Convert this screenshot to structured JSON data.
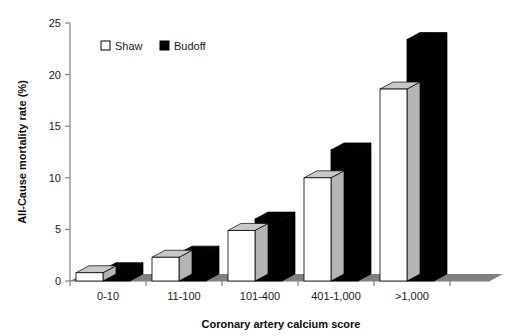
{
  "chart_data": {
    "type": "bar",
    "title": "",
    "xlabel": "Coronary artery calcium score",
    "ylabel": "All-Cause mortality rate (%)",
    "categories": [
      "0-10",
      "11-100",
      "101-400",
      "401-1,000",
      ">1,000"
    ],
    "series": [
      {
        "name": "Shaw",
        "values": [
          0.8,
          2.3,
          4.9,
          10.0,
          18.6
        ],
        "color": "#ffffff",
        "edge": "#000000"
      },
      {
        "name": "Budoff",
        "values": [
          1.1,
          2.7,
          6.0,
          12.7,
          23.4
        ],
        "color": "#000000",
        "edge": "#000000"
      }
    ],
    "ylim": [
      0,
      25
    ],
    "yticks": [
      0,
      5,
      10,
      15,
      20,
      25
    ],
    "ytick_labels": [
      "0",
      "5",
      "10",
      "15",
      "20",
      "25"
    ],
    "grid": false,
    "legend_position": "top-left-inside",
    "style": "3d-bars",
    "floor_color": "#808080",
    "top_face_color": "#c8c8c8",
    "axis_color": "#808080"
  },
  "legend": {
    "items": [
      {
        "label": "Shaw",
        "swatch": "white-square-icon"
      },
      {
        "label": "Budoff",
        "swatch": "black-square-icon"
      }
    ]
  },
  "axes": {
    "y_title": "All-Cause mortality rate (%)",
    "x_title": "Coronary artery calcium score",
    "y_tick_labels": [
      "25",
      "20",
      "15",
      "10",
      "5",
      "0"
    ],
    "x_tick_labels": [
      "0-10",
      "11-100",
      "101-400",
      "401-1,000",
      ">1,000"
    ]
  }
}
